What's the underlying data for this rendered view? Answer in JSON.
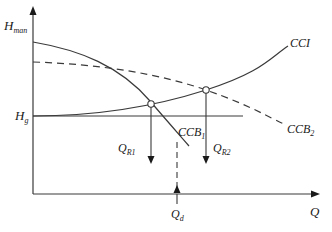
{
  "diagram": {
    "type": "pump-system-characteristic-curves",
    "axes": {
      "y_label": "H",
      "y_label_sub": "man",
      "x_label": "Q"
    },
    "levels": {
      "static_head_label": "H",
      "static_head_sub": "g"
    },
    "curves": [
      {
        "name": "CCI",
        "label": "CCI",
        "label_sub": "",
        "style": "solid",
        "description": "system characteristic curve"
      },
      {
        "name": "CCB1",
        "label": "CCB",
        "label_sub": "1",
        "style": "solid",
        "description": "pump curve 1"
      },
      {
        "name": "CCB2",
        "label": "CCB",
        "label_sub": "2",
        "style": "dashed",
        "description": "pump curve 2"
      }
    ],
    "flow_markers": [
      {
        "label": "Q",
        "label_sub": "R1",
        "style": "solid-arrow-down"
      },
      {
        "label": "Q",
        "label_sub": "R2",
        "style": "solid-arrow-down"
      },
      {
        "label": "Q",
        "label_sub": "d",
        "style": "dashed-arrow-up"
      }
    ],
    "colors": {
      "line": "#3a3a3a",
      "background": "#ffffff"
    }
  }
}
